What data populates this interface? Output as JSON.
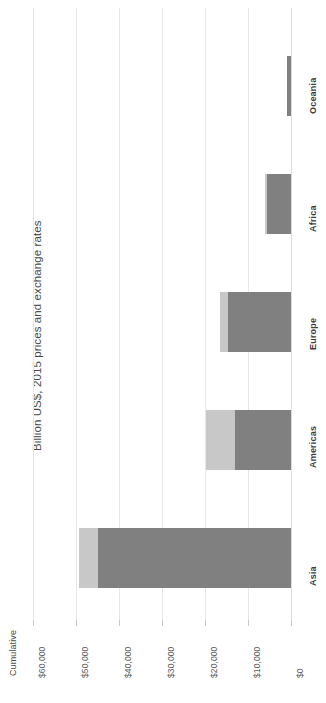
{
  "chart": {
    "title": "Billion US$, 2015 prices and exchange rates",
    "series_label": "Cumulative",
    "orientation": "rotated-90-bar"
  },
  "axis": {
    "ticks": [
      "$60,000",
      "$50,000",
      "$40,000",
      "$30,000",
      "$20,000",
      "$10,000",
      "$0"
    ]
  },
  "categories": {
    "asia": "Asia",
    "americas": "Americas",
    "europe": "Europe",
    "africa": "Africa",
    "oceania": "Oceania"
  },
  "colors": {
    "base": "#808080",
    "cumulative": "#c8c8c8",
    "gridline": "#e6e6e6",
    "text": "#4a4a4a",
    "background": "#ffffff"
  },
  "chart_data": {
    "type": "bar",
    "title": "Billion US$, 2015 prices and exchange rates",
    "xlabel": "",
    "ylabel": "",
    "orientation": "horizontal-stacked",
    "categories": [
      "Asia",
      "Americas",
      "Europe",
      "Africa",
      "Oceania"
    ],
    "series": [
      {
        "name": "Base",
        "color": "#808080",
        "values": [
          44900,
          13000,
          14700,
          5600,
          900
        ]
      },
      {
        "name": "Cumulative",
        "color": "#c8c8c8",
        "values": [
          4400,
          6800,
          1800,
          400,
          100
        ]
      }
    ],
    "totals": [
      49300,
      19800,
      16500,
      6000,
      1000
    ],
    "xlim": [
      0,
      60000
    ],
    "xticks": [
      0,
      10000,
      20000,
      30000,
      40000,
      50000,
      60000
    ],
    "xticklabels": [
      "$0",
      "$10,000",
      "$20,000",
      "$30,000",
      "$40,000",
      "$50,000",
      "$60,000"
    ],
    "grid": true,
    "legend": "none"
  }
}
